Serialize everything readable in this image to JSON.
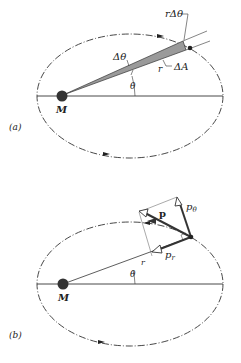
{
  "figure_a": {
    "panel_label": "(a)",
    "mass_label": "M",
    "labels": {
      "r_dtheta": "rΔθ",
      "dtheta": "Δθ",
      "dA": "ΔA",
      "r": "r",
      "theta": "θ"
    }
  },
  "figure_b": {
    "panel_label": "(b)",
    "mass_label": "M",
    "labels": {
      "p": "p",
      "p_theta": "pθ",
      "p_theta_base": "p",
      "p_theta_sub": "θ",
      "p_r_base": "p",
      "p_r_sub": "r",
      "r": "r",
      "theta": "θ"
    }
  },
  "colors": {
    "ink": "#222222",
    "wedge_fill": "#9a9a9a",
    "background": "#ffffff"
  }
}
